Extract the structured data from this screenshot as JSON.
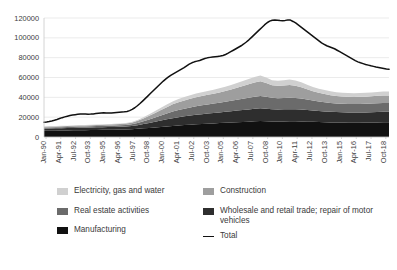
{
  "chart_data": {
    "type": "area",
    "title": "",
    "xlabel": "",
    "ylabel": "",
    "ylim": [
      0,
      120000
    ],
    "ytick_step": 20000,
    "yticks": [
      0,
      20000,
      40000,
      60000,
      80000,
      100000,
      120000
    ],
    "ytick_labels": [
      "0",
      "20000",
      "40000",
      "60000",
      "80000",
      "100000",
      "120000"
    ],
    "grid": true,
    "stacked": true,
    "legend_position": "bottom",
    "x_tick_labels": [
      "Jan-90",
      "Apr-91",
      "Jul-92",
      "Oct-93",
      "Jan-95",
      "Apr-96",
      "Jul-97",
      "Oct-98",
      "Jan-00",
      "Apr-01",
      "Jul-02",
      "Oct-03",
      "Jan-05",
      "Apr-06",
      "Jul-07",
      "Oct-08",
      "Jan-10",
      "Apr-11",
      "Jul-12",
      "Oct-13",
      "Jan-15",
      "Apr-16",
      "Jul-17",
      "Oct-18"
    ],
    "x_tick_interval_months": 15,
    "x_start": "Jan-90",
    "x_end": "Oct-19",
    "x": [
      "Jan-90",
      "Jul-90",
      "Jan-91",
      "Jul-91",
      "Jan-92",
      "Jul-92",
      "Jan-93",
      "Jul-93",
      "Jan-94",
      "Jul-94",
      "Jan-95",
      "Jul-95",
      "Jan-96",
      "Jul-96",
      "Jan-97",
      "Jul-97",
      "Jan-98",
      "Jul-98",
      "Jan-99",
      "Jul-99",
      "Jan-00",
      "Jul-00",
      "Jan-01",
      "Jul-01",
      "Jan-02",
      "Jul-02",
      "Jan-03",
      "Jul-03",
      "Jan-04",
      "Jul-04",
      "Jan-05",
      "Jul-05",
      "Jan-06",
      "Jul-06",
      "Jan-07",
      "Jul-07",
      "Jan-08",
      "Jul-08",
      "Jan-09",
      "Jul-09",
      "Jan-10",
      "Jul-10",
      "Jan-11",
      "Jul-11",
      "Jan-12",
      "Jul-12",
      "Jan-13",
      "Jul-13",
      "Jan-14",
      "Jul-14",
      "Jan-15",
      "Jul-15",
      "Jan-16",
      "Jul-16",
      "Jan-17",
      "Jul-17",
      "Jan-18",
      "Jul-18",
      "Jan-19",
      "Oct-19"
    ],
    "series": [
      {
        "name": "Manufacturing",
        "color": "#111111",
        "values": [
          6200,
          6300,
          6400,
          6500,
          6600,
          6700,
          6800,
          6900,
          7000,
          7100,
          7200,
          7300,
          7400,
          7500,
          7600,
          7800,
          8200,
          8700,
          9200,
          9700,
          10200,
          10700,
          11200,
          11600,
          12000,
          12400,
          12800,
          13100,
          13400,
          13700,
          14000,
          14300,
          14600,
          14900,
          15200,
          15500,
          15800,
          16100,
          16000,
          15700,
          15600,
          15700,
          15800,
          15800,
          15700,
          15500,
          15300,
          15100,
          14900,
          14700,
          14600,
          14500,
          14400,
          14400,
          14400,
          14500,
          14600,
          14700,
          14800,
          14800
        ]
      },
      {
        "name": "Wholesale and retail trade; repair of motor vehicles",
        "color": "#2e2e2e",
        "values": [
          2200,
          2250,
          2300,
          2350,
          2400,
          2450,
          2500,
          2550,
          2600,
          2650,
          2700,
          2750,
          2800,
          2900,
          3000,
          3200,
          3700,
          4300,
          5000,
          5700,
          6400,
          7100,
          7800,
          8300,
          8800,
          9200,
          9600,
          9900,
          10200,
          10500,
          10800,
          11100,
          11400,
          11700,
          12000,
          12300,
          12600,
          12800,
          12600,
          12300,
          12200,
          12200,
          12300,
          12200,
          12000,
          11700,
          11400,
          11100,
          10900,
          10700,
          10500,
          10400,
          10300,
          10300,
          10300,
          10300,
          10400,
          10500,
          10600,
          10600
        ]
      },
      {
        "name": "Real estate activities",
        "color": "#6b6b6b",
        "values": [
          1000,
          1030,
          1060,
          1090,
          1120,
          1150,
          1180,
          1210,
          1240,
          1270,
          1300,
          1340,
          1380,
          1450,
          1550,
          1750,
          2200,
          2800,
          3500,
          4300,
          5100,
          5900,
          6700,
          7300,
          7800,
          8200,
          8600,
          8900,
          9200,
          9500,
          9800,
          10100,
          10500,
          10900,
          11300,
          11700,
          12100,
          12400,
          12000,
          11500,
          11400,
          11500,
          11600,
          11400,
          11000,
          10500,
          10000,
          9600,
          9300,
          9000,
          8800,
          8700,
          8600,
          8600,
          8650,
          8700,
          8800,
          8900,
          9000,
          9000
        ]
      },
      {
        "name": "Construction",
        "color": "#9e9e9e",
        "values": [
          900,
          920,
          940,
          960,
          980,
          1000,
          1020,
          1040,
          1060,
          1090,
          1120,
          1160,
          1220,
          1320,
          1450,
          1700,
          2200,
          2900,
          3700,
          4600,
          5500,
          6400,
          7200,
          7800,
          8300,
          8700,
          9100,
          9400,
          9700,
          10000,
          10400,
          10900,
          11500,
          12200,
          13000,
          13800,
          14500,
          14900,
          13800,
          12600,
          12400,
          12600,
          12800,
          12300,
          11400,
          10400,
          9400,
          8700,
          8200,
          7800,
          7500,
          7300,
          7200,
          7150,
          7150,
          7200,
          7300,
          7400,
          7500,
          7500
        ]
      },
      {
        "name": "Electricity, gas and water",
        "color": "#d0d0d0",
        "values": [
          300,
          310,
          320,
          330,
          340,
          350,
          360,
          370,
          380,
          390,
          400,
          420,
          450,
          500,
          570,
          700,
          950,
          1250,
          1600,
          1950,
          2300,
          2650,
          3000,
          3250,
          3450,
          3600,
          3750,
          3850,
          3950,
          4050,
          4150,
          4300,
          4450,
          4650,
          4900,
          5200,
          5600,
          5900,
          5600,
          5200,
          5150,
          5300,
          5450,
          5300,
          5000,
          4700,
          4400,
          4200,
          4050,
          3950,
          3850,
          3800,
          3780,
          3780,
          3800,
          3850,
          3900,
          3950,
          4000,
          4000
        ]
      }
    ],
    "total": {
      "name": "Total",
      "color": "#111111",
      "values": [
        15000,
        15400,
        16000,
        16800,
        17800,
        18900,
        20000,
        21000,
        21800,
        22400,
        23000,
        23300,
        23500,
        23200,
        23600,
        24400,
        24200,
        24600,
        25000,
        25200,
        25600,
        28000,
        31000,
        34500,
        38500,
        42500,
        46500,
        50500,
        54500,
        58500,
        62500,
        66500,
        70000,
        73000,
        75500,
        77500,
        79500,
        81000,
        81500,
        82000,
        83000,
        85000,
        87000,
        89500,
        92000,
        95000,
        98000,
        101000,
        104000,
        107000,
        110000,
        113500,
        116000,
        117500,
        118000,
        117800,
        117500,
        117700,
        117800,
        116500
      ]
    },
    "total_detail": [
      15000,
      15200,
      15600,
      16200,
      16900,
      17700,
      18600,
      19500,
      20300,
      21000,
      21600,
      22100,
      22500,
      22900,
      23200,
      23300,
      23200,
      23000,
      23100,
      23300,
      23600,
      23900,
      24200,
      24400,
      24300,
      24100,
      24200,
      24500,
      24800,
      25000,
      25200,
      25400,
      25800,
      26600,
      27800,
      29500,
      31500,
      33800,
      36200,
      38700,
      41200,
      43800,
      46400,
      49000,
      51500,
      54000,
      56400,
      58600,
      60600,
      62400,
      64000,
      65500,
      67000,
      68500,
      70000,
      71800,
      73500,
      74800,
      75800,
      76500,
      77200,
      78200,
      79200,
      79800,
      80300,
      80700,
      81000,
      81300,
      81600,
      82200,
      83200,
      84500,
      86000,
      87500,
      89000,
      90500,
      92000,
      93800,
      95800,
      98000,
      100500,
      103000,
      105500,
      108000,
      110500,
      113000,
      115200,
      116800,
      117800,
      118000,
      117800,
      117500,
      117300,
      117600,
      118000,
      117900,
      116500,
      115000,
      113000,
      111000,
      109000,
      107000,
      105000,
      103000,
      101000,
      99000,
      97000,
      95000,
      93500,
      92000,
      91000,
      90000,
      89000,
      87500,
      86000,
      84500,
      83000,
      81500,
      80000,
      78500,
      77000,
      75800,
      74800,
      74000,
      73200,
      72500,
      71800,
      71200,
      70500,
      70000,
      69500,
      69000,
      68500,
      68200
    ]
  },
  "legend": {
    "items": [
      {
        "label": "Electricity, gas and water",
        "color": "#d0d0d0",
        "marker": "swatch",
        "column": "left"
      },
      {
        "label": "Real estate activities",
        "color": "#6b6b6b",
        "marker": "swatch",
        "column": "left"
      },
      {
        "label": "Manufacturing",
        "color": "#111111",
        "marker": "swatch",
        "column": "left"
      },
      {
        "label": "Construction",
        "color": "#9e9e9e",
        "marker": "swatch",
        "column": "right"
      },
      {
        "label": "Wholesale and retail trade; repair of motor vehicles",
        "color": "#2e2e2e",
        "marker": "swatch",
        "column": "right"
      },
      {
        "label": "Total",
        "color": "#111111",
        "marker": "line",
        "column": "right"
      }
    ]
  },
  "axes": {
    "y_tick_labels": [
      "120000",
      "100000",
      "80000",
      "60000",
      "40000",
      "20000",
      "0"
    ],
    "x_tick_labels": [
      "Jan-90",
      "Apr-91",
      "Jul-92",
      "Oct-93",
      "Jan-95",
      "Apr-96",
      "Jul-97",
      "Oct-98",
      "Jan-00",
      "Apr-01",
      "Jul-02",
      "Oct-03",
      "Jan-05",
      "Apr-06",
      "Jul-07",
      "Oct-08",
      "Jan-10",
      "Apr-11",
      "Jul-12",
      "Oct-13",
      "Jan-15",
      "Apr-16",
      "Jul-17",
      "Oct-18"
    ]
  }
}
